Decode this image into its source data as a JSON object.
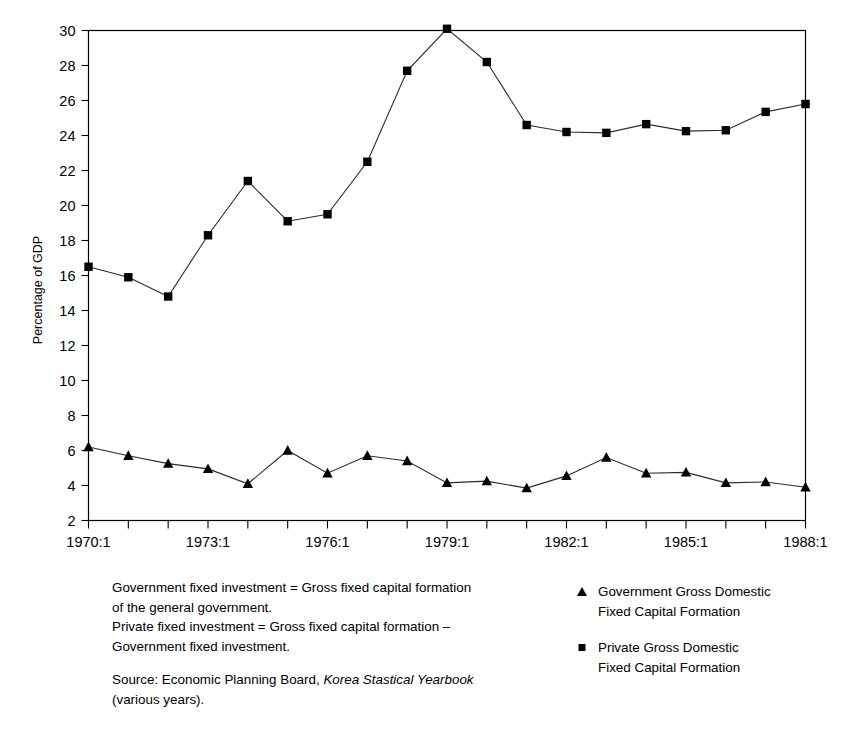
{
  "chart_data": {
    "type": "line",
    "title": "",
    "xlabel": "",
    "ylabel": "Percentage of GDP",
    "ylim": [
      2,
      30
    ],
    "ytick_step": 2,
    "yticks": [
      2,
      4,
      6,
      8,
      10,
      12,
      14,
      16,
      18,
      20,
      22,
      24,
      26,
      28,
      30
    ],
    "x": [
      "1970:1",
      "1971:1",
      "1972:1",
      "1973:1",
      "1974:1",
      "1975:1",
      "1976:1",
      "1977:1",
      "1978:1",
      "1979:1",
      "1980:1",
      "1981:1",
      "1982:1",
      "1983:1",
      "1984:1",
      "1985:1",
      "1986:1",
      "1987:1",
      "1988:1"
    ],
    "xtick_labels_shown": [
      "1970:1",
      "1973:1",
      "1976:1",
      "1979:1",
      "1982:1",
      "1985:1",
      "1988:1"
    ],
    "xtick_label_every": 3,
    "grid": false,
    "legend_position": "below-right",
    "series": [
      {
        "name": "Government Gross Domestic Fixed Capital Formation",
        "marker": "triangle",
        "color": "#000000",
        "values": [
          6.2,
          5.7,
          5.25,
          4.95,
          4.1,
          6.0,
          4.7,
          5.7,
          5.4,
          4.15,
          4.25,
          3.85,
          4.55,
          5.6,
          4.7,
          4.75,
          4.15,
          4.2,
          3.9
        ]
      },
      {
        "name": "Private Gross Domestic Fixed Capital Formation",
        "marker": "square",
        "color": "#000000",
        "values": [
          16.5,
          15.9,
          14.8,
          18.3,
          21.4,
          19.1,
          19.5,
          22.5,
          27.7,
          30.1,
          28.2,
          24.6,
          24.2,
          24.15,
          24.65,
          24.25,
          24.3,
          25.35,
          25.8
        ]
      }
    ]
  },
  "notes": {
    "definition_line1": "Government fixed investment = Gross fixed capital formation",
    "definition_line2": "of the general government.",
    "definition_line3": "Private fixed investment = Gross fixed capital formation –",
    "definition_line4": "Government fixed investment.",
    "source_prefix": "Source: Economic Planning Board, ",
    "source_italic": "Korea Stastical Yearbook",
    "source_suffix": "(various years)."
  },
  "legend": {
    "items": [
      {
        "marker": "triangle",
        "line1": "Government Gross Domestic",
        "line2": "Fixed Capital Formation"
      },
      {
        "marker": "square",
        "line1": "Private Gross Domestic",
        "line2": "Fixed Capital Formation"
      }
    ]
  }
}
